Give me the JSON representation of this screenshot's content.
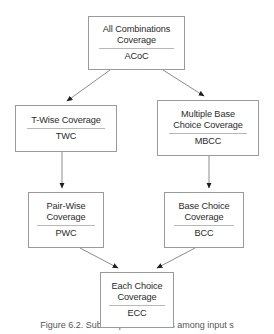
{
  "figure": {
    "caption": "Figure 6.2. Subsumption relations among input s",
    "width": 274,
    "height": 334,
    "background_color": "#ffffff",
    "box_border_color": "#9a9a9a",
    "edge_color": "#8c8c8c",
    "text_color": "#2b2b2b"
  },
  "nodes": [
    {
      "id": "acoc",
      "name": "All Combinations\nCoverage",
      "acronym": "ACoC"
    },
    {
      "id": "twc",
      "name": "T-Wise Coverage",
      "acronym": "TWC"
    },
    {
      "id": "mbcc",
      "name": "Multiple Base\nChoice Coverage",
      "acronym": "MBCC"
    },
    {
      "id": "pwc",
      "name": "Pair-Wise\nCoverage",
      "acronym": "PWC"
    },
    {
      "id": "bcc",
      "name": "Base Choice\nCoverage",
      "acronym": "BCC"
    },
    {
      "id": "ecc",
      "name": "Each Choice\nCoverage",
      "acronym": "ECC"
    }
  ],
  "edges": [
    {
      "from": "acoc",
      "to": "twc"
    },
    {
      "from": "acoc",
      "to": "mbcc"
    },
    {
      "from": "twc",
      "to": "pwc"
    },
    {
      "from": "mbcc",
      "to": "bcc"
    },
    {
      "from": "pwc",
      "to": "ecc"
    },
    {
      "from": "bcc",
      "to": "ecc"
    }
  ]
}
